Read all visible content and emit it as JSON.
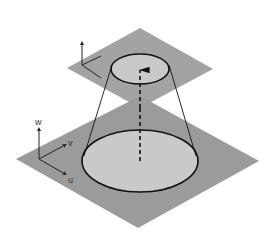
{
  "diagram": {
    "type": "projection-cone",
    "background": "#ffffff",
    "colors": {
      "plane": "#9b9b9b",
      "ellipse_fill": "#c9c9c9",
      "stroke": "#111111"
    },
    "lower_plane": {
      "vertices": [
        [
          140,
          96
        ],
        [
          259,
          161
        ],
        [
          138,
          228
        ],
        [
          16,
          159
        ]
      ],
      "axes": {
        "origin": [
          39,
          159
        ],
        "w_end": [
          39,
          129
        ],
        "v_end": [
          65,
          145
        ],
        "u_end": [
          65,
          174
        ],
        "labels": {
          "w": "w",
          "v": "v",
          "u": "u"
        }
      },
      "ellipse": {
        "cx": 140,
        "cy": 161,
        "rx": 58,
        "ry": 31
      }
    },
    "upper_plane": {
      "vertices": [
        [
          140,
          28
        ],
        [
          213,
          69
        ],
        [
          140,
          108
        ],
        [
          67,
          68
        ]
      ],
      "axes": {
        "origin": [
          82,
          65
        ],
        "up_end": [
          82,
          43
        ],
        "v_end": [
          101,
          56
        ],
        "u_end": [
          101,
          78
        ]
      },
      "ellipse": {
        "cx": 140,
        "cy": 69,
        "rx": 29,
        "ry": 15
      }
    },
    "cone_lines": [
      [
        [
          112,
          65
        ],
        [
          84,
          156
        ]
      ],
      [
        [
          169,
          65
        ],
        [
          196,
          156
        ]
      ]
    ],
    "center_arrow": {
      "from": [
        140,
        161
      ],
      "to": [
        140,
        70
      ]
    }
  }
}
